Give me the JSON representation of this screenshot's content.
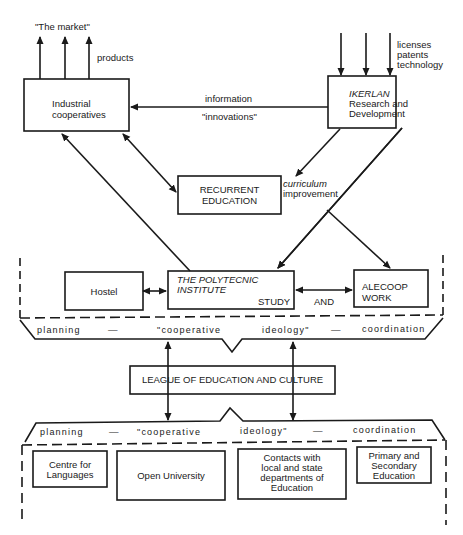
{
  "top_left": {
    "market_label": "\"The market\"",
    "products_label": "products",
    "box": {
      "line1": "Industrial",
      "line2": "cooperatives"
    }
  },
  "top_right": {
    "inputs": [
      "licenses",
      "patents",
      "technology"
    ],
    "box": {
      "line1": "IKERLAN",
      "line2": "Research and",
      "line3": "Development"
    }
  },
  "flow_labels": {
    "information": "information",
    "innovations": "\"innovations\"",
    "curriculum": "curriculum",
    "improvement": "improvement"
  },
  "recurrent": {
    "line1": "RECURRENT",
    "line2": "EDUCATION"
  },
  "middle_row": {
    "hostel": "Hostel",
    "polytechnic": {
      "line1": "THE POLYTECNIC",
      "line2": "INSTITUTE",
      "study": "STUDY"
    },
    "and_label": "AND",
    "alecoop": {
      "line1": "ALECOOP",
      "line2": "WORK"
    }
  },
  "banner_top": {
    "words": [
      "planning",
      "—",
      "\"cooperative",
      "ideology\"",
      "—",
      "coordination"
    ]
  },
  "league": "LEAGUE OF EDUCATION AND CULTURE",
  "banner_bottom": {
    "words": [
      "planning",
      "—",
      "\"cooperative",
      "ideology\"",
      "—",
      "coordination"
    ]
  },
  "bottom_row": {
    "languages": {
      "line1": "Centre for",
      "line2": "Languages"
    },
    "open_university": "Open University",
    "contacts": {
      "line1": "Contacts with",
      "line2": "local and state",
      "line3": "departments of",
      "line4": "Education"
    },
    "primary": {
      "line1": "Primary and",
      "line2": "Secondary",
      "line3": "Education"
    }
  },
  "colors": {
    "ink": "#1a1a1a",
    "paper": "#ffffff"
  }
}
